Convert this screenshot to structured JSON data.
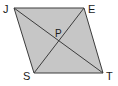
{
  "figure": {
    "name": "parallelogram-with-diagonals",
    "type": "geometry-diagram",
    "background_color": "#ffffff",
    "fill_color": "#c6c6c6",
    "stroke_color": "#3c3c3c",
    "stroke_width": 1,
    "label_color": "#1a1a1a"
  },
  "labels": {
    "j": "J",
    "e": "E",
    "s": "S",
    "t": "T",
    "p": "P"
  },
  "vertices": {
    "J": {
      "x": 14,
      "y": 8
    },
    "E": {
      "x": 84,
      "y": 8
    },
    "T": {
      "x": 103,
      "y": 73
    },
    "S": {
      "x": 34,
      "y": 73
    },
    "P": {
      "x": 58.5,
      "y": 40.5
    }
  },
  "label_positions": {
    "J": {
      "x": 3,
      "y": 13
    },
    "E": {
      "x": 88,
      "y": 13
    },
    "S": {
      "x": 23,
      "y": 80
    },
    "T": {
      "x": 106,
      "y": 80
    },
    "P": {
      "x": 55,
      "y": 37
    }
  },
  "shape": {
    "polygon_points": "14,8 84,8 103,73 34,73",
    "diagonals": [
      {
        "name": "diagonal-JT",
        "from": "J",
        "to": "T"
      },
      {
        "name": "diagonal-ES",
        "from": "E",
        "to": "S"
      }
    ]
  }
}
